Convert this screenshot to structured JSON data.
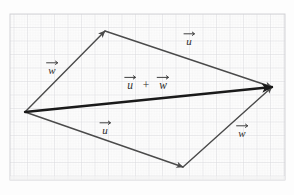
{
  "figure": {
    "background_color": "#fdfdfd",
    "paper_tint": "#fbfbfb"
  },
  "grid": {
    "minor_color": "#e9e9ea",
    "major_color": "#d9d9dc",
    "border_color": "#cfcfd3",
    "minor_spacing_px": 2.7,
    "major_spacing_px": 13.5,
    "left": 10,
    "top": 14,
    "right": 285,
    "bottom": 180
  },
  "points": {
    "origin": {
      "name": "origin",
      "x": 25,
      "y": 112
    },
    "top_apex": {
      "name": "top-apex",
      "x": 105,
      "y": 31
    },
    "bottom_vertex": {
      "name": "bottom-vertex",
      "x": 183,
      "y": 167
    },
    "resultant_tip": {
      "name": "resultant-tip",
      "x": 272,
      "y": 87
    }
  },
  "colors": {
    "vector_thin": "#4a4a4a",
    "vector_bold": "#1a1a1a",
    "label_text": "#2b2b2b"
  },
  "vectors": [
    {
      "id": "w-upper-left",
      "label": "w",
      "accent": "arrow",
      "from": "origin",
      "to": "top_apex",
      "stroke_width": 1.4,
      "color": "#4a4a4a",
      "label_x": 52,
      "label_y": 70
    },
    {
      "id": "u-upper-right",
      "label": "u",
      "accent": "arrow",
      "from": "top_apex",
      "to": "resultant_tip",
      "stroke_width": 1.4,
      "color": "#4a4a4a",
      "label_x": 189,
      "label_y": 41
    },
    {
      "id": "u-lower-left",
      "label": "u",
      "accent": "arrow",
      "from": "origin",
      "to": "bottom_vertex",
      "stroke_width": 1.4,
      "color": "#4a4a4a",
      "label_x": 105,
      "label_y": 130
    },
    {
      "id": "w-lower-right",
      "label": "w",
      "accent": "arrow",
      "from": "bottom_vertex",
      "to": "resultant_tip",
      "stroke_width": 1.4,
      "color": "#4a4a4a",
      "label_x": 242,
      "label_y": 133
    },
    {
      "id": "u-plus-w-resultant",
      "label": "u + w",
      "accent": "arrow",
      "from": "origin",
      "to": "resultant_tip",
      "stroke_width": 2.4,
      "color": "#1a1a1a",
      "label_x": 146,
      "label_y": 85
    }
  ],
  "labels": {
    "w_upper": "w",
    "u_upper": "u",
    "u_lower": "u",
    "w_lower": "w",
    "sum_u": "u",
    "sum_plus": "+",
    "sum_w": "w"
  }
}
